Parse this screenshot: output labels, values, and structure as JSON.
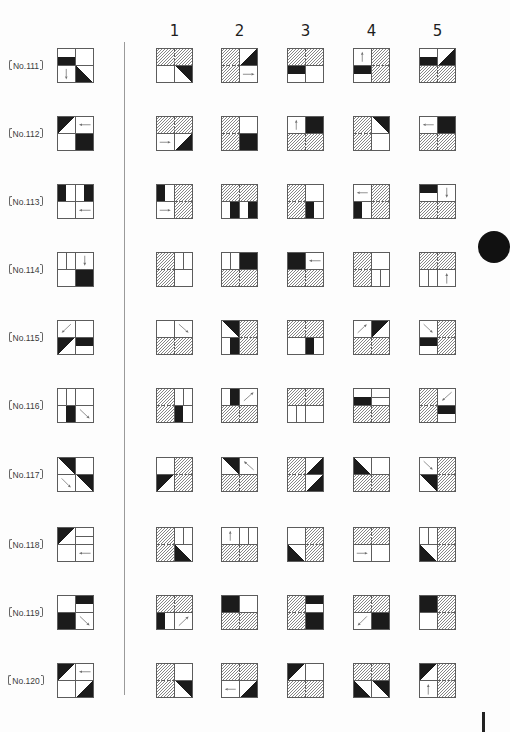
{
  "column_headers": [
    "1",
    "2",
    "3",
    "4",
    "5"
  ],
  "colors": {
    "ink": "#1b1b1b",
    "grid": "#5c5c5c",
    "hatch": "#858585",
    "arrow": "#6e6e6e",
    "divider": "#9a9a9a"
  },
  "questions": [
    {
      "label": "No.111",
      "figure": [
        "bar-bottom",
        "empty",
        "arrow-down",
        "tri-bl"
      ],
      "options": [
        [
          "hatch",
          "hatch",
          "empty",
          "tri-tr"
        ],
        [
          "hatch",
          "tri-br",
          "hatch",
          "arrow-right"
        ],
        [
          "hatch",
          "hatch",
          "bar-top",
          "empty"
        ],
        [
          "arrow-up",
          "hatch",
          "bar-top",
          "hatch"
        ],
        [
          "bar-bottom",
          "tri-br",
          "hatch",
          "hatch"
        ]
      ]
    },
    {
      "label": "No.112",
      "figure": [
        "tri-tl",
        "arrow-left",
        "empty",
        "black"
      ],
      "options": [
        [
          "hatch",
          "hatch",
          "arrow-right",
          "tri-br"
        ],
        [
          "hatch",
          "empty",
          "hatch",
          "black"
        ],
        [
          "arrow-up",
          "black",
          "hatch",
          "hatch"
        ],
        [
          "hatch",
          "tri-tr",
          "hatch",
          "empty"
        ],
        [
          "arrow-left",
          "black",
          "hatch",
          "hatch"
        ]
      ]
    },
    {
      "label": "No.113",
      "figure": [
        "bar-left",
        "bar-right",
        "empty",
        "arrow-left"
      ],
      "options": [
        [
          "bar-left",
          "hatch",
          "arrow-right",
          "hatch"
        ],
        [
          "hatch",
          "hatch",
          "bar-right",
          "bar-right"
        ],
        [
          "hatch",
          "empty",
          "hatch",
          "bar-left"
        ],
        [
          "arrow-left",
          "hatch",
          "bar-left",
          "hatch"
        ],
        [
          "bar-top",
          "arrow-down",
          "hatch",
          "hatch"
        ]
      ]
    },
    {
      "label": "No.114",
      "figure": [
        "split-v",
        "arrow-down",
        "empty",
        "black"
      ],
      "options": [
        [
          "hatch",
          "split-v",
          "hatch",
          "empty"
        ],
        [
          "split-v",
          "black",
          "hatch",
          "hatch"
        ],
        [
          "black",
          "arrow-left",
          "hatch",
          "hatch"
        ],
        [
          "hatch",
          "empty",
          "hatch",
          "split-v"
        ],
        [
          "hatch",
          "hatch",
          "split-v",
          "arrow-up"
        ]
      ]
    },
    {
      "label": "No.115",
      "figure": [
        "arrow-dl",
        "empty",
        "tri-tl",
        "bar-top"
      ],
      "options": [
        [
          "empty",
          "arrow-dr",
          "hatch",
          "hatch"
        ],
        [
          "tri-tr",
          "hatch",
          "bar-right",
          "hatch"
        ],
        [
          "hatch",
          "hatch",
          "empty",
          "bar-left"
        ],
        [
          "arrow-ur",
          "tri-tl",
          "hatch",
          "hatch"
        ],
        [
          "arrow-dr",
          "hatch",
          "bar-top",
          "hatch"
        ]
      ]
    },
    {
      "label": "No.116",
      "figure": [
        "split-v",
        "empty",
        "bar-right",
        "arrow-dr"
      ],
      "options": [
        [
          "hatch",
          "split-v",
          "hatch",
          "bar-left"
        ],
        [
          "bar-right",
          "arrow-ur",
          "hatch",
          "hatch"
        ],
        [
          "hatch",
          "hatch",
          "split-v",
          "empty"
        ],
        [
          "bar-bottom",
          "split-h",
          "hatch",
          "hatch"
        ],
        [
          "hatch",
          "arrow-dl",
          "hatch",
          "bar-top"
        ]
      ]
    },
    {
      "label": "No.117",
      "figure": [
        "tri-tr",
        "empty",
        "arrow-dr",
        "tri-tr"
      ],
      "options": [
        [
          "empty",
          "hatch",
          "tri-tl",
          "hatch"
        ],
        [
          "tri-tr",
          "arrow-ul",
          "hatch",
          "hatch"
        ],
        [
          "hatch",
          "tri-br",
          "hatch",
          "tri-br"
        ],
        [
          "tri-bl",
          "empty",
          "hatch",
          "hatch"
        ],
        [
          "arrow-dr",
          "hatch",
          "tri-tr",
          "hatch"
        ]
      ]
    },
    {
      "label": "No.118",
      "figure": [
        "tri-tl",
        "split-h",
        "empty",
        "arrow-left"
      ],
      "options": [
        [
          "hatch",
          "split-v",
          "hatch",
          "tri-bl"
        ],
        [
          "arrow-up",
          "split-v",
          "hatch",
          "hatch"
        ],
        [
          "empty",
          "hatch",
          "tri-bl",
          "hatch"
        ],
        [
          "hatch",
          "hatch",
          "arrow-right",
          "empty"
        ],
        [
          "split-v",
          "hatch",
          "tri-bl",
          "hatch"
        ]
      ]
    },
    {
      "label": "No.119",
      "figure": [
        "empty",
        "bar-top",
        "black",
        "arrow-dr"
      ],
      "options": [
        [
          "hatch",
          "hatch",
          "bar-left",
          "arrow-ur"
        ],
        [
          "black",
          "empty",
          "hatch",
          "hatch"
        ],
        [
          "hatch",
          "bar-top",
          "hatch",
          "black"
        ],
        [
          "hatch",
          "hatch",
          "arrow-dl",
          "black"
        ],
        [
          "black",
          "hatch",
          "empty",
          "hatch"
        ]
      ]
    },
    {
      "label": "No.120",
      "figure": [
        "tri-tl",
        "arrow-left",
        "empty",
        "tri-br"
      ],
      "options": [
        [
          "hatch",
          "empty",
          "hatch",
          "tri-tr"
        ],
        [
          "hatch",
          "hatch",
          "arrow-left",
          "tri-br"
        ],
        [
          "tri-tl",
          "empty",
          "hatch",
          "hatch"
        ],
        [
          "hatch",
          "hatch",
          "tri-bl",
          "tri-tr"
        ],
        [
          "tri-tl",
          "hatch",
          "arrow-up",
          "hatch"
        ]
      ]
    }
  ]
}
